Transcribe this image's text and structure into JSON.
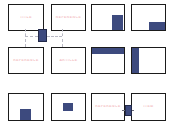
{
  "canvas": {
    "width": 172,
    "height": 132,
    "background": "#ffffff"
  },
  "palette": {
    "frame_border": "#1b1b1b",
    "frame_fill": "#ffffff",
    "block_blue": "#3d4a7e",
    "hub_blue": "#3d4a7e",
    "label_pink": "#f2b9bd",
    "connector_gray": "#b9b9c4"
  },
  "grid": {
    "columns": 4,
    "rows": 3,
    "total_frames": 12
  },
  "frames": [
    {
      "id": "frame-r1c1",
      "row": 1,
      "col": 1,
      "label": "TITLE",
      "has_label": true,
      "blocks": []
    },
    {
      "id": "frame-r1c2",
      "row": 1,
      "col": 2,
      "label": "REFERENCE",
      "has_label": true,
      "blocks": []
    },
    {
      "id": "frame-r1c3",
      "row": 1,
      "col": 3,
      "label": "",
      "has_label": false,
      "blocks": [
        {
          "name": "block-bottom-right-tall",
          "left": "62%",
          "top": "40%",
          "width": "34%",
          "height": "60%"
        }
      ]
    },
    {
      "id": "frame-r1c4",
      "row": 1,
      "col": 4,
      "label": "",
      "has_label": false,
      "blocks": [
        {
          "name": "block-bottom-right-wide",
          "left": "50%",
          "top": "68%",
          "width": "50%",
          "height": "32%"
        }
      ]
    },
    {
      "id": "frame-r2c1",
      "row": 2,
      "col": 1,
      "label": "REFERENCE",
      "has_label": true,
      "blocks": []
    },
    {
      "id": "frame-r2c2",
      "row": 2,
      "col": 2,
      "label": "ARTICLE",
      "has_label": true,
      "blocks": []
    },
    {
      "id": "frame-r2c3",
      "row": 2,
      "col": 3,
      "label": "",
      "has_label": false,
      "blocks": [
        {
          "name": "block-top-banner",
          "left": "0%",
          "top": "0%",
          "width": "100%",
          "height": "24%"
        }
      ]
    },
    {
      "id": "frame-r2c4",
      "row": 2,
      "col": 4,
      "label": "",
      "has_label": false,
      "blocks": [
        {
          "name": "block-left-sidebar",
          "left": "0%",
          "top": "0%",
          "width": "20%",
          "height": "100%"
        }
      ]
    },
    {
      "id": "frame-r3c1",
      "row": 3,
      "col": 1,
      "label": "",
      "has_label": false,
      "blocks": [
        {
          "name": "block-bottom-center",
          "left": "32%",
          "top": "58%",
          "width": "34%",
          "height": "42%"
        }
      ]
    },
    {
      "id": "frame-r3c2",
      "row": 3,
      "col": 2,
      "label": "",
      "has_label": false,
      "blocks": [
        {
          "name": "block-center",
          "left": "33%",
          "top": "33%",
          "width": "32%",
          "height": "32%"
        }
      ]
    },
    {
      "id": "frame-r3c3",
      "row": 3,
      "col": 3,
      "label": "REFERENCE",
      "has_label": true,
      "blocks": []
    },
    {
      "id": "frame-r3c4",
      "row": 3,
      "col": 4,
      "label": "ITEM",
      "has_label": true,
      "blocks": []
    }
  ],
  "hubs": [
    {
      "id": "hub-top-center",
      "name": "connector-hub-top",
      "left": 38,
      "top": 29,
      "width": 9,
      "height": 13
    },
    {
      "id": "hub-bottom-row",
      "name": "connector-hub-bottom",
      "left": 125,
      "top": 105,
      "width": 7,
      "height": 11
    }
  ],
  "connectors": [
    {
      "id": "conn-1",
      "name": "connector-up-left",
      "type": "vertical",
      "left": 25,
      "top": 29,
      "length": 7
    },
    {
      "id": "conn-2",
      "name": "connector-up-right",
      "type": "vertical",
      "left": 62,
      "top": 29,
      "length": 7
    },
    {
      "id": "conn-3",
      "name": "connector-down-left",
      "type": "vertical",
      "left": 25,
      "top": 39,
      "length": 8
    },
    {
      "id": "conn-4",
      "name": "connector-down-right",
      "type": "vertical",
      "left": 62,
      "top": 39,
      "length": 8
    },
    {
      "id": "conn-5",
      "name": "connector-bar-left",
      "type": "horizontal",
      "left": 25,
      "top": 36,
      "length": 13
    },
    {
      "id": "conn-6",
      "name": "connector-bar-right",
      "type": "horizontal",
      "left": 47,
      "top": 36,
      "length": 15
    },
    {
      "id": "conn-7",
      "name": "connector-bottom-link",
      "type": "solid",
      "left": 122,
      "top": 110,
      "length": 12
    }
  ]
}
